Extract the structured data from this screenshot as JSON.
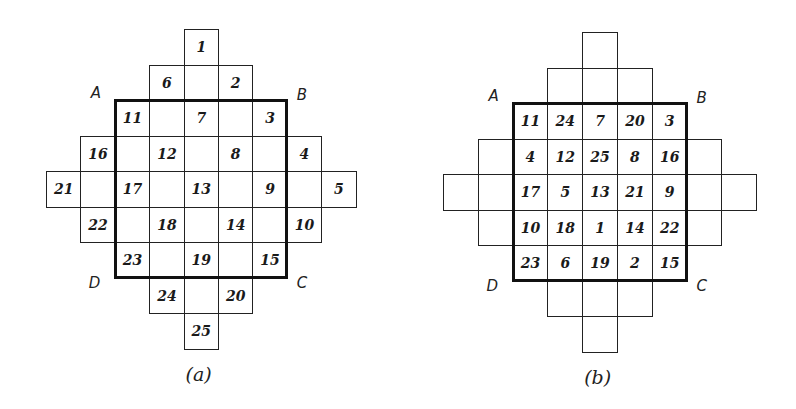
{
  "figures": [
    {
      "id": "a",
      "caption": "(a)",
      "corners": {
        "A": "A",
        "B": "B",
        "C": "C",
        "D": "D"
      },
      "origin": [
        46,
        29
      ],
      "cell": [
        34.4,
        35.5
      ],
      "bold_square": {
        "col": 2,
        "row": 2,
        "size": 5
      },
      "cells": [
        {
          "r": 0,
          "c": 4,
          "v": "1"
        },
        {
          "r": 1,
          "c": 3,
          "v": "6"
        },
        {
          "r": 1,
          "c": 4,
          "v": ""
        },
        {
          "r": 1,
          "c": 5,
          "v": "2"
        },
        {
          "r": 2,
          "c": 2,
          "v": "11"
        },
        {
          "r": 2,
          "c": 3,
          "v": ""
        },
        {
          "r": 2,
          "c": 4,
          "v": "7"
        },
        {
          "r": 2,
          "c": 5,
          "v": ""
        },
        {
          "r": 2,
          "c": 6,
          "v": "3"
        },
        {
          "r": 3,
          "c": 1,
          "v": "16"
        },
        {
          "r": 3,
          "c": 2,
          "v": ""
        },
        {
          "r": 3,
          "c": 3,
          "v": "12"
        },
        {
          "r": 3,
          "c": 4,
          "v": ""
        },
        {
          "r": 3,
          "c": 5,
          "v": "8"
        },
        {
          "r": 3,
          "c": 6,
          "v": ""
        },
        {
          "r": 3,
          "c": 7,
          "v": "4"
        },
        {
          "r": 4,
          "c": 0,
          "v": "21"
        },
        {
          "r": 4,
          "c": 1,
          "v": ""
        },
        {
          "r": 4,
          "c": 2,
          "v": "17"
        },
        {
          "r": 4,
          "c": 3,
          "v": ""
        },
        {
          "r": 4,
          "c": 4,
          "v": "13"
        },
        {
          "r": 4,
          "c": 5,
          "v": ""
        },
        {
          "r": 4,
          "c": 6,
          "v": "9"
        },
        {
          "r": 4,
          "c": 7,
          "v": ""
        },
        {
          "r": 4,
          "c": 8,
          "v": "5"
        },
        {
          "r": 5,
          "c": 1,
          "v": "22"
        },
        {
          "r": 5,
          "c": 2,
          "v": ""
        },
        {
          "r": 5,
          "c": 3,
          "v": "18"
        },
        {
          "r": 5,
          "c": 4,
          "v": ""
        },
        {
          "r": 5,
          "c": 5,
          "v": "14"
        },
        {
          "r": 5,
          "c": 6,
          "v": ""
        },
        {
          "r": 5,
          "c": 7,
          "v": "10"
        },
        {
          "r": 6,
          "c": 2,
          "v": "23"
        },
        {
          "r": 6,
          "c": 3,
          "v": ""
        },
        {
          "r": 6,
          "c": 4,
          "v": "19"
        },
        {
          "r": 6,
          "c": 5,
          "v": ""
        },
        {
          "r": 6,
          "c": 6,
          "v": "15"
        },
        {
          "r": 7,
          "c": 3,
          "v": "24"
        },
        {
          "r": 7,
          "c": 4,
          "v": ""
        },
        {
          "r": 7,
          "c": 5,
          "v": "20"
        },
        {
          "r": 8,
          "c": 4,
          "v": "25"
        }
      ]
    },
    {
      "id": "b",
      "caption": "(b)",
      "corners": {
        "A": "A",
        "B": "B",
        "C": "C",
        "D": "D"
      },
      "origin": [
        443,
        32
      ],
      "cell": [
        34.8,
        35.5
      ],
      "bold_square": {
        "col": 2,
        "row": 2,
        "size": 5
      },
      "cells": [
        {
          "r": 0,
          "c": 4,
          "v": ""
        },
        {
          "r": 1,
          "c": 3,
          "v": ""
        },
        {
          "r": 1,
          "c": 4,
          "v": ""
        },
        {
          "r": 1,
          "c": 5,
          "v": ""
        },
        {
          "r": 2,
          "c": 2,
          "v": "11"
        },
        {
          "r": 2,
          "c": 3,
          "v": "24"
        },
        {
          "r": 2,
          "c": 4,
          "v": "7"
        },
        {
          "r": 2,
          "c": 5,
          "v": "20"
        },
        {
          "r": 2,
          "c": 6,
          "v": "3"
        },
        {
          "r": 3,
          "c": 1,
          "v": ""
        },
        {
          "r": 3,
          "c": 2,
          "v": "4"
        },
        {
          "r": 3,
          "c": 3,
          "v": "12"
        },
        {
          "r": 3,
          "c": 4,
          "v": "25"
        },
        {
          "r": 3,
          "c": 5,
          "v": "8"
        },
        {
          "r": 3,
          "c": 6,
          "v": "16"
        },
        {
          "r": 3,
          "c": 7,
          "v": ""
        },
        {
          "r": 4,
          "c": 0,
          "v": ""
        },
        {
          "r": 4,
          "c": 1,
          "v": ""
        },
        {
          "r": 4,
          "c": 2,
          "v": "17"
        },
        {
          "r": 4,
          "c": 3,
          "v": "5"
        },
        {
          "r": 4,
          "c": 4,
          "v": "13"
        },
        {
          "r": 4,
          "c": 5,
          "v": "21"
        },
        {
          "r": 4,
          "c": 6,
          "v": "9"
        },
        {
          "r": 4,
          "c": 7,
          "v": ""
        },
        {
          "r": 4,
          "c": 8,
          "v": ""
        },
        {
          "r": 5,
          "c": 1,
          "v": ""
        },
        {
          "r": 5,
          "c": 2,
          "v": "10"
        },
        {
          "r": 5,
          "c": 3,
          "v": "18"
        },
        {
          "r": 5,
          "c": 4,
          "v": "1"
        },
        {
          "r": 5,
          "c": 5,
          "v": "14"
        },
        {
          "r": 5,
          "c": 6,
          "v": "22"
        },
        {
          "r": 5,
          "c": 7,
          "v": ""
        },
        {
          "r": 6,
          "c": 2,
          "v": "23"
        },
        {
          "r": 6,
          "c": 3,
          "v": "6"
        },
        {
          "r": 6,
          "c": 4,
          "v": "19"
        },
        {
          "r": 6,
          "c": 5,
          "v": "2"
        },
        {
          "r": 6,
          "c": 6,
          "v": "15"
        },
        {
          "r": 7,
          "c": 3,
          "v": ""
        },
        {
          "r": 7,
          "c": 4,
          "v": ""
        },
        {
          "r": 7,
          "c": 5,
          "v": ""
        },
        {
          "r": 8,
          "c": 4,
          "v": ""
        }
      ]
    }
  ]
}
